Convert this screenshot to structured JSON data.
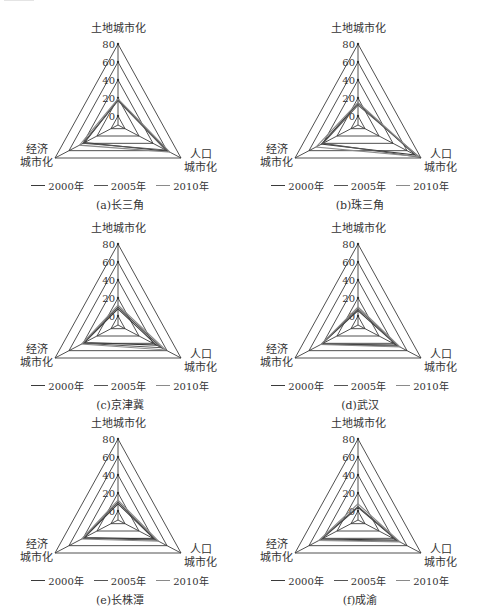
{
  "figure": {
    "axis_labels": {
      "land": "土地城市化",
      "population_line1": "人口",
      "population_line2": "城市化",
      "economic_line1": "经济",
      "economic_line2": "城市化"
    },
    "ticks": [
      "80",
      "60",
      "40",
      "20",
      "0"
    ],
    "legend": [
      {
        "label": "2000年",
        "color": "#3a3a3a"
      },
      {
        "label": "2005年",
        "color": "#555555"
      },
      {
        "label": "2010年",
        "color": "#8a8a8a"
      }
    ]
  },
  "panels": [
    {
      "caption": "(a)长三角"
    },
    {
      "caption": "(b)珠三角"
    },
    {
      "caption": "(c)京津冀"
    },
    {
      "caption": "(d)武汉"
    },
    {
      "caption": "(e)长株潭"
    },
    {
      "caption": "(f)成渝"
    }
  ],
  "chart_data": [
    {
      "type": "radar",
      "title": "(a)长三角",
      "axes": [
        "土地城市化",
        "人口城市化",
        "经济城市化"
      ],
      "range": [
        -10,
        80
      ],
      "rings": [
        0,
        20,
        40,
        60,
        80
      ],
      "series": [
        {
          "name": "2000年",
          "values": [
            18,
            62,
            38
          ]
        },
        {
          "name": "2005年",
          "values": [
            17,
            58,
            40
          ]
        },
        {
          "name": "2010年",
          "values": [
            19,
            64,
            45
          ]
        }
      ],
      "legend_position": "bottom"
    },
    {
      "type": "radar",
      "title": "(b)珠三角",
      "axes": [
        "土地城市化",
        "人口城市化",
        "经济城市化"
      ],
      "range": [
        -10,
        80
      ],
      "rings": [
        0,
        20,
        40,
        60,
        80
      ],
      "series": [
        {
          "name": "2000年",
          "values": [
            14,
            72,
            42
          ]
        },
        {
          "name": "2005年",
          "values": [
            12,
            78,
            40
          ]
        },
        {
          "name": "2010年",
          "values": [
            15,
            76,
            50
          ]
        }
      ],
      "legend_position": "bottom"
    },
    {
      "type": "radar",
      "title": "(c)京津冀",
      "axes": [
        "土地城市化",
        "人口城市化",
        "经济城市化"
      ],
      "range": [
        -10,
        80
      ],
      "rings": [
        0,
        20,
        40,
        60,
        80
      ],
      "series": [
        {
          "name": "2000年",
          "values": [
            8,
            45,
            38
          ]
        },
        {
          "name": "2005年",
          "values": [
            10,
            52,
            40
          ]
        },
        {
          "name": "2010年",
          "values": [
            12,
            58,
            42
          ]
        }
      ],
      "legend_position": "bottom"
    },
    {
      "type": "radar",
      "title": "(d)武汉",
      "axes": [
        "土地城市化",
        "人口城市化",
        "经济城市化"
      ],
      "range": [
        -10,
        80
      ],
      "rings": [
        0,
        20,
        40,
        60,
        80
      ],
      "series": [
        {
          "name": "2000年",
          "values": [
            6,
            45,
            42
          ]
        },
        {
          "name": "2005年",
          "values": [
            8,
            48,
            42
          ]
        },
        {
          "name": "2010年",
          "values": [
            10,
            50,
            43
          ]
        }
      ],
      "legend_position": "bottom"
    },
    {
      "type": "radar",
      "title": "(e)长株潭",
      "axes": [
        "土地城市化",
        "人口城市化",
        "经济城市化"
      ],
      "range": [
        -10,
        80
      ],
      "rings": [
        0,
        20,
        40,
        60,
        80
      ],
      "series": [
        {
          "name": "2000年",
          "values": [
            8,
            42,
            38
          ]
        },
        {
          "name": "2005年",
          "values": [
            10,
            45,
            40
          ]
        },
        {
          "name": "2010年",
          "values": [
            12,
            48,
            42
          ]
        }
      ],
      "legend_position": "bottom"
    },
    {
      "type": "radar",
      "title": "(f)成渝",
      "axes": [
        "土地城市化",
        "人口城市化",
        "经济城市化"
      ],
      "range": [
        -10,
        80
      ],
      "rings": [
        0,
        20,
        40,
        60,
        80
      ],
      "series": [
        {
          "name": "2000年",
          "values": [
            4,
            45,
            42
          ]
        },
        {
          "name": "2005年",
          "values": [
            5,
            48,
            44
          ]
        },
        {
          "name": "2010年",
          "values": [
            8,
            50,
            46
          ]
        }
      ],
      "legend_position": "bottom"
    }
  ]
}
